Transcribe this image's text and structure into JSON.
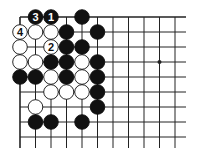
{
  "diagram": {
    "type": "go-board-fragment",
    "grid": {
      "origin_x": 20,
      "origin_y": 17,
      "step_x": 15.5,
      "step_y": 15,
      "cols": 11,
      "rows": 9,
      "line_right_x": 186,
      "line_bottom_extend_y": 148,
      "top_edge": true,
      "left_edge": true,
      "line_color": "#222222",
      "edge_width": 1.6,
      "line_width": 1
    },
    "star_points": [
      {
        "col": 9,
        "row": 3
      }
    ],
    "stones": [
      {
        "col": 1,
        "row": 0,
        "color": "black",
        "label": "3"
      },
      {
        "col": 2,
        "row": 0,
        "color": "black",
        "label": "1"
      },
      {
        "col": 4,
        "row": 0,
        "color": "black",
        "label": ""
      },
      {
        "col": 0,
        "row": 1,
        "color": "white",
        "label": "4"
      },
      {
        "col": 1,
        "row": 1,
        "color": "white",
        "label": ""
      },
      {
        "col": 2,
        "row": 1,
        "color": "white",
        "label": ""
      },
      {
        "col": 3,
        "row": 1,
        "color": "black",
        "label": ""
      },
      {
        "col": 5,
        "row": 1,
        "color": "black",
        "label": ""
      },
      {
        "col": 0,
        "row": 2,
        "color": "white",
        "label": ""
      },
      {
        "col": 2,
        "row": 2,
        "color": "white",
        "label": "2"
      },
      {
        "col": 3,
        "row": 2,
        "color": "black",
        "label": ""
      },
      {
        "col": 4,
        "row": 2,
        "color": "black",
        "label": ""
      },
      {
        "col": 0,
        "row": 3,
        "color": "white",
        "label": ""
      },
      {
        "col": 1,
        "row": 3,
        "color": "white",
        "label": ""
      },
      {
        "col": 2,
        "row": 3,
        "color": "black",
        "label": ""
      },
      {
        "col": 3,
        "row": 3,
        "color": "black",
        "label": ""
      },
      {
        "col": 4,
        "row": 3,
        "color": "white",
        "label": ""
      },
      {
        "col": 5,
        "row": 3,
        "color": "black",
        "label": ""
      },
      {
        "col": 0,
        "row": 4,
        "color": "black",
        "label": ""
      },
      {
        "col": 1,
        "row": 4,
        "color": "black",
        "label": ""
      },
      {
        "col": 2,
        "row": 4,
        "color": "white",
        "label": ""
      },
      {
        "col": 3,
        "row": 4,
        "color": "black",
        "label": ""
      },
      {
        "col": 4,
        "row": 4,
        "color": "white",
        "label": ""
      },
      {
        "col": 5,
        "row": 4,
        "color": "black",
        "label": ""
      },
      {
        "col": 2,
        "row": 5,
        "color": "white",
        "label": ""
      },
      {
        "col": 3,
        "row": 5,
        "color": "white",
        "label": ""
      },
      {
        "col": 4,
        "row": 5,
        "color": "white",
        "label": ""
      },
      {
        "col": 5,
        "row": 5,
        "color": "black",
        "label": ""
      },
      {
        "col": 1,
        "row": 6,
        "color": "white",
        "label": ""
      },
      {
        "col": 5,
        "row": 6,
        "color": "black",
        "label": ""
      },
      {
        "col": 1,
        "row": 7,
        "color": "black",
        "label": ""
      },
      {
        "col": 2,
        "row": 7,
        "color": "black",
        "label": ""
      },
      {
        "col": 4,
        "row": 7,
        "color": "black",
        "label": ""
      }
    ],
    "colors": {
      "black_stone": "#111111",
      "white_stone": "#ffffff",
      "stone_outline": "#111111",
      "label_on_black": "#ffffff",
      "label_on_white": "#111111"
    }
  }
}
